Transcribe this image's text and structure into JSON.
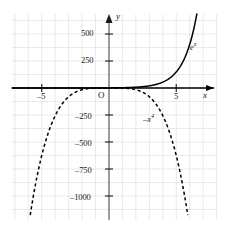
{
  "chart_data": {
    "type": "line",
    "title": "",
    "subtitle": "",
    "xlabel": "x",
    "ylabel": "y",
    "grid": true,
    "legend_position": "inline-curve-labels",
    "origin_label": "O",
    "xlim": [
      -7.2,
      8.1
    ],
    "ylim": [
      -1220,
      690
    ],
    "x_ticks": [
      -5,
      5
    ],
    "x_tick_labels": [
      "–5",
      "5"
    ],
    "y_ticks": [
      500,
      250,
      -250,
      -500,
      -750,
      -1000
    ],
    "y_tick_labels": [
      "500",
      "250",
      "–250",
      "–500",
      "–750",
      "–1000"
    ],
    "series": [
      {
        "name": "e^x",
        "label_text": "e",
        "label_exponent": "x",
        "style": "solid",
        "color": "#000000",
        "x": [
          -7.2,
          -6.0,
          -5.0,
          -4.0,
          -3.0,
          -2.0,
          -1.0,
          0.0,
          1.0,
          2.0,
          3.0,
          4.0,
          4.5,
          5.0,
          5.5,
          6.0,
          6.3,
          6.5
        ],
        "y": [
          0.0007,
          0.0025,
          0.0067,
          0.018,
          0.05,
          0.135,
          0.368,
          1,
          2.72,
          7.39,
          20.1,
          54.6,
          90.0,
          148.4,
          244.7,
          403.4,
          544.6,
          665.1
        ]
      },
      {
        "name": "-x^4",
        "label_text": "–x",
        "label_exponent": "4",
        "style": "dashed",
        "color": "#000000",
        "x": [
          -5.9,
          -5.5,
          -5.0,
          -4.5,
          -4.0,
          -3.5,
          -3.0,
          -2.5,
          -2.0,
          -1.5,
          -1.0,
          -0.5,
          0.0,
          0.5,
          1.0,
          1.5,
          2.0,
          2.5,
          3.0,
          3.5,
          4.0,
          4.5,
          5.0,
          5.5,
          5.9
        ],
        "y": [
          -1211,
          -915,
          -625,
          -410,
          -256,
          -150,
          -81,
          -39,
          -16,
          -5.1,
          -1,
          -0.06,
          0,
          -0.06,
          -1,
          -5.1,
          -16,
          -39,
          -81,
          -150,
          -256,
          -410,
          -625,
          -915,
          -1211
        ]
      }
    ]
  },
  "axes": {
    "y_axis_name": "y",
    "x_axis_name": "x",
    "origin": "O"
  },
  "labels": {
    "y_500": "500",
    "y_250": "250",
    "y_neg250": "–250",
    "y_neg500": "–500",
    "y_neg750": "–750",
    "y_neg1000": "–1000",
    "x_neg5": "–5",
    "x_pos5": "5"
  },
  "colors": {
    "grid": "#e3e3ea",
    "axis": "#000000",
    "curve": "#000000",
    "background": "#ffffff"
  }
}
